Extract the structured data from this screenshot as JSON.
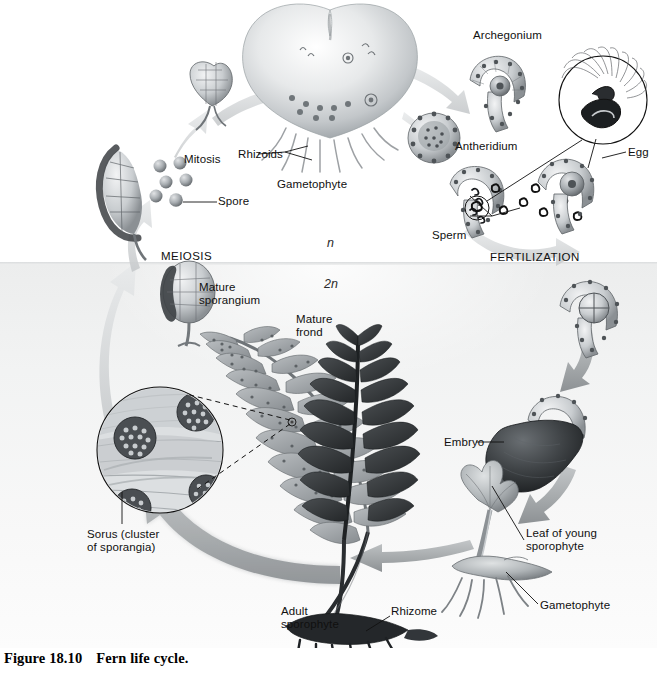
{
  "caption": {
    "number": "Figure 18.10",
    "title": "Fern life cycle."
  },
  "ploidy": {
    "haploid": "n",
    "diploid": "2n"
  },
  "phases": {
    "meiosis": "MEIOSIS",
    "fertilization": "FERTILIZATION",
    "mitosis": "Mitosis"
  },
  "labels": {
    "spore": "Spore",
    "rhizoids": "Rhizoids",
    "gametophyte_top": "Gametophyte",
    "archegonium": "Archegonium",
    "antheridium": "Antheridium",
    "egg": "Egg",
    "sperm": "Sperm",
    "mature_sporangium": "Mature\nsporangium",
    "mature_frond": "Mature\nfrond",
    "sorus": "Sorus (cluster\nof sporangia)",
    "embryo": "Embryo",
    "leaf_of_young_sporophyte": "Leaf of young\nsporophyte",
    "gametophyte_bottom": "Gametophyte",
    "adult_sporophyte": "Adult\nsporophyte",
    "rhizome": "Rhizome"
  },
  "structures": {
    "heart_gametophyte": "heart-shaped-gametophyte",
    "young_gametophyte": "young-gametophyte",
    "sporangium_releasing_spores": "sporangium-releasing-spores",
    "mature_sporangium_icon": "mature-sporangium",
    "archegonium_icon": "archegonium",
    "antheridium_icon": "antheridium",
    "sperm_inset": "sperm-magnified-inset",
    "egg_archegonium": "egg-in-archegonium",
    "zygote": "zygote-in-archegonium",
    "embryo_icon": "embryo-attached-to-gametophyte",
    "young_sporophyte": "young-sporophyte-with-gametophyte",
    "adult_sporophyte_icon": "adult-sporophyte-fronds",
    "light_frond": "mature-frond-underside-with-sori",
    "dark_frond": "mature-frond-upper-surface",
    "sorus_inset": "sorus-magnified-inset",
    "rhizome_icon": "rhizome-with-roots"
  },
  "colors": {
    "band_diploid": "#eceded",
    "band_haploid": "#ffffff",
    "arrow": "#a8abad",
    "ink": "#111111",
    "tissue_dark": "#3a3c3e",
    "tissue_mid": "#8f9396",
    "tissue_light": "#cfd2d4"
  }
}
